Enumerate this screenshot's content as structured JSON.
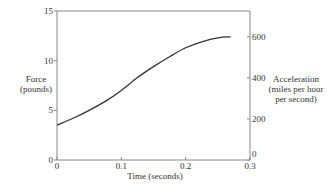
{
  "chart_data": {
    "type": "line",
    "title": "",
    "xlabel": "Time (seconds)",
    "ylabel": "Force (pounds)",
    "ylabel_right": "Acceleration (miles per hour per second)",
    "xlim": [
      0,
      0.3
    ],
    "ylim": [
      0,
      15
    ],
    "ylim_right": [
      0,
      725
    ],
    "x_ticks": [
      "0",
      "0.1",
      "0.2",
      "0.3"
    ],
    "y_ticks": [
      "0",
      "5",
      "10",
      "15"
    ],
    "y_right_ticks": [
      "0",
      "200",
      "400",
      "600"
    ],
    "grid": false,
    "legend": null,
    "series": [
      {
        "name": "Force",
        "x": [
          0,
          0.025,
          0.05,
          0.075,
          0.1,
          0.125,
          0.15,
          0.175,
          0.2,
          0.225,
          0.25,
          0.27
        ],
        "values": [
          3.5,
          4.2,
          5.0,
          5.9,
          7.0,
          8.3,
          9.4,
          10.4,
          11.3,
          11.9,
          12.3,
          12.4
        ]
      }
    ]
  },
  "labels": {
    "ylabel_left_line1": "Force",
    "ylabel_left_line2": "(pounds)",
    "ylabel_right_line1": "Acceleration",
    "ylabel_right_line2": "(miles per hour",
    "ylabel_right_line3": "per second)",
    "xlabel": "Time (seconds)"
  },
  "colors": {
    "axis": "#888888",
    "line": "#333333",
    "text": "#333333"
  }
}
